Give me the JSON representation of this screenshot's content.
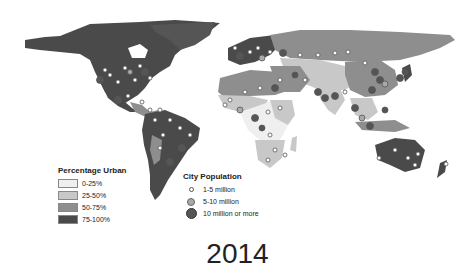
{
  "map": {
    "type": "choropleth-with-proportional-symbols",
    "subject": "World urbanization and city population",
    "colors": {
      "background": "#ffffff",
      "urban_0_25": "#efefef",
      "urban_25_50": "#c8c8c8",
      "urban_50_75": "#8e8e8e",
      "urban_75_100": "#4a4a4a"
    }
  },
  "legend_urban": {
    "title": "Percentage Urban",
    "items": [
      {
        "label": "0-25%",
        "color": "#efefef"
      },
      {
        "label": "25-50%",
        "color": "#c8c8c8"
      },
      {
        "label": "50-75%",
        "color": "#8e8e8e"
      },
      {
        "label": "75-100%",
        "color": "#4a4a4a"
      }
    ]
  },
  "legend_city": {
    "title": "City Population",
    "items": [
      {
        "label": "1-5 million",
        "size": 5,
        "color": "#ffffff",
        "stroke": "#555555"
      },
      {
        "label": "5-10 million",
        "size": 8,
        "color": "#a9a9a9",
        "stroke": "#666666"
      },
      {
        "label": "10 million or more",
        "size": 11,
        "color": "#555555",
        "stroke": "#333333"
      }
    ]
  },
  "year_label": "2014"
}
